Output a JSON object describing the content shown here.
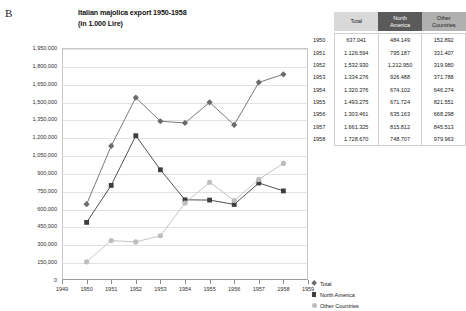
{
  "figure_label": "B",
  "chart": {
    "title_line1": "Italian majolica export 1950-1958",
    "title_line2": "(in 1.000 Lire)"
  },
  "legend": {
    "items": [
      {
        "label": "Total",
        "marker": "diamond-marker-icon",
        "color": "#6b6b6b"
      },
      {
        "label": "North America",
        "marker": "square-marker-icon",
        "color": "#3d3d3d"
      },
      {
        "label": "Other Countries",
        "marker": "circle-marker-icon",
        "color": "#bdbdbd"
      }
    ]
  },
  "table": {
    "headers": [
      "",
      "Total",
      "North America",
      "Other Countries"
    ],
    "header_colors": {
      "total": "#d9d9d9",
      "north_america": "#5a5a5a",
      "other_countries": "#b0b0b0"
    },
    "rows": [
      {
        "year": "1950",
        "total": "637.041",
        "north_america": "484.149",
        "other_countries": "152.892"
      },
      {
        "year": "1951",
        "total": "1.126.594",
        "north_america": "795.187",
        "other_countries": "331.407"
      },
      {
        "year": "1952",
        "total": "1.532.930",
        "north_america": "1.212.950",
        "other_countries": "319.980"
      },
      {
        "year": "1953",
        "total": "1.334.276",
        "north_america": "926.488",
        "other_countries": "371.788"
      },
      {
        "year": "1954",
        "total": "1.320.376",
        "north_america": "674.102",
        "other_countries": "646.274"
      },
      {
        "year": "1955",
        "total": "1.493.275",
        "north_america": "671.724",
        "other_countries": "821.551"
      },
      {
        "year": "1956",
        "total": "1.303.461",
        "north_america": "635.163",
        "other_countries": "668.298"
      },
      {
        "year": "1957",
        "total": "1.661.325",
        "north_america": "815.812",
        "other_countries": "845.513"
      },
      {
        "year": "1958",
        "total": "1.728.670",
        "north_america": "748.707",
        "other_countries": "979.963"
      }
    ]
  },
  "chart_data": {
    "type": "line",
    "title": "Italian majolica export 1950-1958 (in 1.000 Lire)",
    "xlabel": "",
    "ylabel": "",
    "x": [
      1950,
      1951,
      1952,
      1953,
      1954,
      1955,
      1956,
      1957,
      1958
    ],
    "xlim": [
      1949,
      1959
    ],
    "xticks": [
      "1949",
      "1950",
      "1951",
      "1952",
      "1953",
      "1954",
      "1955",
      "1956",
      "1957",
      "1958",
      "1959"
    ],
    "ylim": [
      0,
      1950000
    ],
    "yticks": [
      "0",
      "150,000",
      "300,000",
      "450,000",
      "600,000",
      "750,000",
      "900,000",
      "1,050,000",
      "1,200,000",
      "1,350,000",
      "1,500,000",
      "1,650,000",
      "1,800,000",
      "1,950,000"
    ],
    "grid": true,
    "legend_position": "right",
    "series": [
      {
        "name": "Total",
        "marker": "diamond",
        "color": "#6b6b6b",
        "values": [
          637041,
          1126594,
          1532930,
          1334276,
          1320376,
          1493275,
          1303461,
          1661325,
          1728670
        ]
      },
      {
        "name": "North America",
        "marker": "square",
        "color": "#3d3d3d",
        "values": [
          484149,
          795187,
          1212950,
          926488,
          674102,
          671724,
          635163,
          815812,
          748707
        ]
      },
      {
        "name": "Other Countries",
        "marker": "circle",
        "color": "#bdbdbd",
        "values": [
          152892,
          331407,
          319980,
          371788,
          646274,
          821551,
          668298,
          845513,
          979963
        ]
      }
    ]
  }
}
